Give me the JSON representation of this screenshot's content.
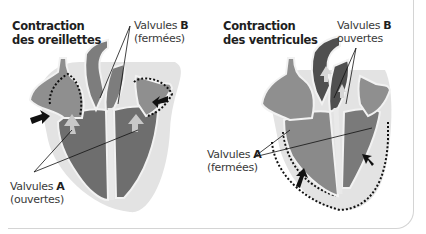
{
  "panels": [
    {
      "title_line1": "Contraction",
      "title_line2": "des oreillettes",
      "label_b_prefix": "Valvules ",
      "label_b_letter": "B",
      "label_b_state": "(fermées)",
      "label_a_prefix": "Valvules ",
      "label_a_letter": "A",
      "label_a_state": "(ouvertes)"
    },
    {
      "title_line1": "Contraction",
      "title_line2": "des ventricules",
      "label_b_prefix": "Valvules ",
      "label_b_letter": "B",
      "label_b_state": "ouvertes",
      "label_a_prefix": "Valvules ",
      "label_a_letter": "A",
      "label_a_state": "(fermées)"
    }
  ],
  "colors": {
    "halo": "#e3e3e3",
    "atrium": "#8f8f8f",
    "ventricle": "#6e6e6e",
    "ventricle_contracted": "#8a8a8a",
    "artery": "#7d7d7d",
    "artery_dark": "#4f4f4f",
    "outline": "#f2f2f2",
    "arrow": "#111111"
  }
}
